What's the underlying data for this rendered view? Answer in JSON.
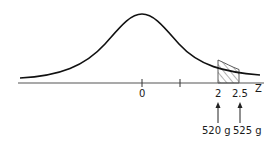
{
  "diagram": {
    "type": "normal-distribution",
    "axis_label": "Z",
    "ticks": [
      {
        "value": "0",
        "x": 142
      },
      {
        "value": "",
        "x": 180
      },
      {
        "value": "2",
        "x": 218
      },
      {
        "value": "2.5",
        "x": 239
      }
    ],
    "shaded_region": {
      "from_z": "2",
      "to_z": "2.5"
    },
    "annotations": [
      {
        "z": "2",
        "label": "520 g"
      },
      {
        "z": "2.5",
        "label": "525 g"
      }
    ],
    "colors": {
      "curve": "#111111",
      "axis": "#555555",
      "hatch": "#444444"
    }
  }
}
